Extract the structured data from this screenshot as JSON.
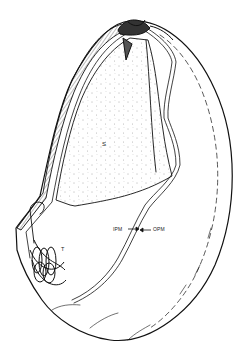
{
  "figure": {
    "type": "line-drawing",
    "colors": {
      "ink": "#111111",
      "background": "#ffffff",
      "stipple": "#555555"
    },
    "labels": {
      "s": "S",
      "t": "T",
      "ipm": "IPM",
      "opm": "OPM"
    },
    "arrows": [
      {
        "label": "IPM",
        "direction": "right"
      },
      {
        "label": "OPM",
        "direction": "left"
      }
    ]
  }
}
